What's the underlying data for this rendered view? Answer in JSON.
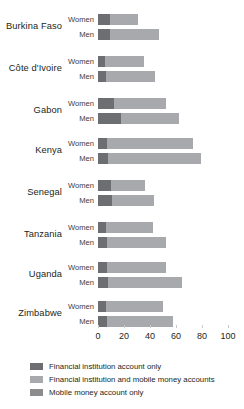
{
  "chart_data": {
    "type": "bar",
    "orientation": "horizontal",
    "stacked": true,
    "title": "",
    "subtitle": "",
    "xlabel": "",
    "ylabel": "",
    "xlim": [
      0,
      100
    ],
    "xticks": [
      0,
      20,
      40,
      60,
      80,
      100
    ],
    "xtick_labels": [
      "0",
      "20",
      "40",
      "60",
      "80",
      "100"
    ],
    "grid": false,
    "legend_position": "bottom-left",
    "categories": [
      "Burkina Faso",
      "Côte d'Ivoire",
      "Gabon",
      "Kenya",
      "Senegal",
      "Tanzania",
      "Uganda",
      "Zimbabwe"
    ],
    "subgroups": [
      "Women",
      "Men"
    ],
    "series": [
      {
        "name": "Financial institution account only",
        "color": "#6d6e71",
        "values_women": [
          9,
          5,
          12,
          7,
          10,
          6,
          7,
          6
        ],
        "values_men": [
          9,
          6,
          18,
          8,
          11,
          7,
          8,
          7
        ]
      },
      {
        "name": "Financial institution and mobile money accounts",
        "color": "#a7a9ac",
        "values_women": [
          22,
          30,
          40,
          66,
          26,
          36,
          45,
          44
        ],
        "values_men": [
          38,
          38,
          44,
          71,
          32,
          45,
          57,
          51
        ]
      },
      {
        "name": "Mobile money account only",
        "color": "#8a8c8e",
        "values_women": [
          0,
          0,
          0,
          0,
          0,
          0,
          0,
          0
        ],
        "values_men": [
          0,
          0,
          0,
          0,
          0,
          0,
          0,
          0
        ]
      }
    ],
    "totals_women": [
      31,
      35,
      52,
      73,
      36,
      42,
      52,
      50
    ],
    "totals_men": [
      47,
      44,
      62,
      79,
      43,
      52,
      65,
      58
    ]
  },
  "legend": {
    "items": [
      {
        "label": "Financial institution account only",
        "color": "#6d6e71"
      },
      {
        "label": "Financial institution and mobile money accounts",
        "color": "#a7a9ac"
      },
      {
        "label": "Mobile money account only",
        "color": "#8a8c8e"
      }
    ]
  },
  "labels": {
    "women": "Women",
    "men": "Men"
  }
}
